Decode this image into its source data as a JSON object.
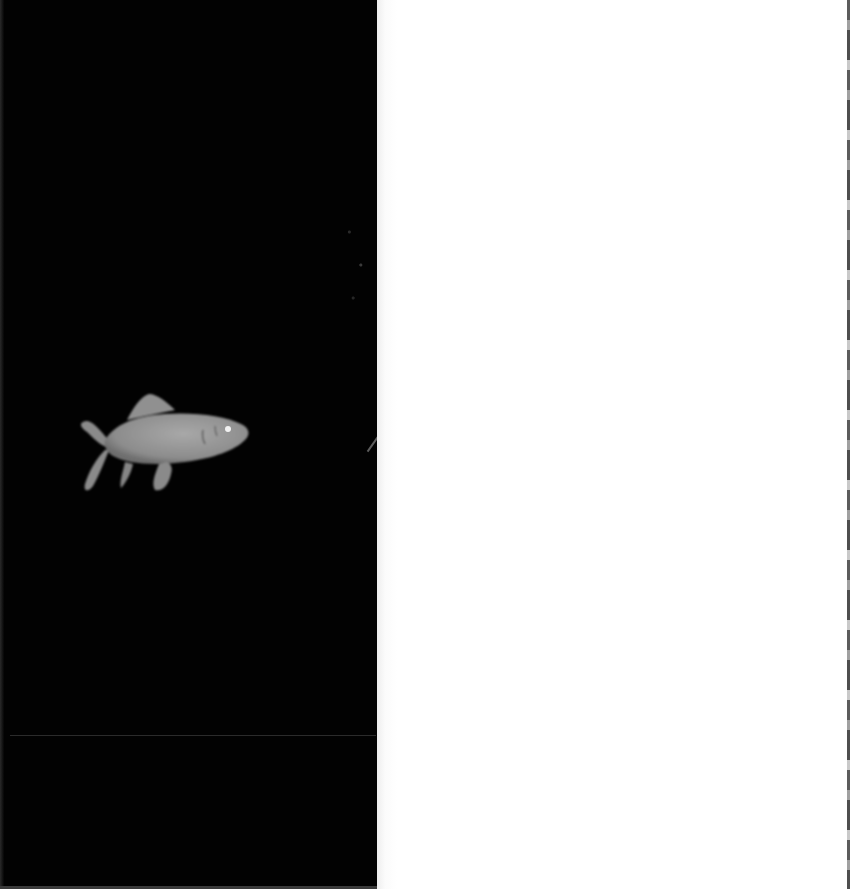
{
  "image": {
    "description": "Grayscale X-ray style photograph of a small fish on a black background; right half of frame is blank white",
    "subject": "fish",
    "colors": {
      "background_left": "#020202",
      "background_right": "#ffffff",
      "fish_body": "#9a9a9a",
      "fish_eye": "#f2f2f2"
    }
  }
}
